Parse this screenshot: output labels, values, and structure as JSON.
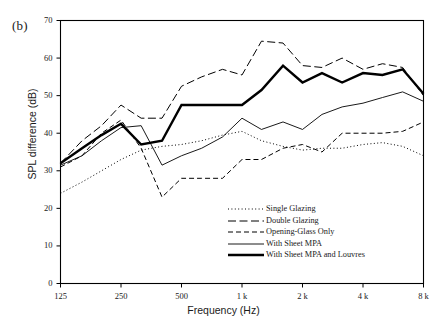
{
  "figure": {
    "panel_label": "(b)",
    "xlabel": "Frequency (Hz)",
    "ylabel": "SPL difference (dB)"
  },
  "axes": {
    "y_ticks": [
      "0",
      "10",
      "20",
      "30",
      "40",
      "50",
      "60",
      "70"
    ],
    "x_ticks": [
      "125",
      "250",
      "500",
      "1 k",
      "2 k",
      "4 k",
      "8 k"
    ]
  },
  "legend": {
    "items": [
      {
        "label": "Single Glazing",
        "style": "dotted"
      },
      {
        "label": "Double Glazing",
        "style": "long-dash"
      },
      {
        "label": "Opening-Glass Only",
        "style": "dash"
      },
      {
        "label": "With Sheet MPA",
        "style": "thin-solid"
      },
      {
        "label": "With Sheet MPA and Louvres",
        "style": "thick-solid"
      }
    ]
  },
  "colors": {
    "line": "#000000",
    "axis": "#000000",
    "background": "#ffffff"
  },
  "chart_data": {
    "type": "line",
    "title": "",
    "subtitle": "",
    "xlabel": "Frequency (Hz)",
    "ylabel": "SPL difference (dB)",
    "xscale": "log",
    "xlim": [
      125,
      8000
    ],
    "ylim": [
      0,
      70
    ],
    "ytick_interval": 10,
    "grid": false,
    "legend_position": "inside lower-right",
    "x": [
      125,
      160,
      200,
      250,
      315,
      400,
      500,
      630,
      800,
      1000,
      1250,
      1600,
      2000,
      2500,
      3150,
      4000,
      5000,
      6300,
      8000
    ],
    "x_tick_labels": [
      "125",
      "250",
      "500",
      "1 k",
      "2 k",
      "4 k",
      "8 k"
    ],
    "x_tick_values": [
      125,
      250,
      500,
      1000,
      2000,
      4000,
      8000
    ],
    "series": [
      {
        "name": "Single Glazing",
        "style": "dotted",
        "values": [
          24,
          27,
          30,
          33,
          35.5,
          36.5,
          37,
          38,
          39.5,
          40.5,
          38,
          36.5,
          35.5,
          36,
          36,
          37,
          37.5,
          36.5,
          34
        ]
      },
      {
        "name": "Double Glazing",
        "style": "long-dash",
        "values": [
          32,
          38,
          42,
          47.5,
          44,
          44,
          52.5,
          55,
          57,
          55.5,
          64.5,
          64,
          58,
          57.5,
          60,
          57,
          58.5,
          57.5,
          50
        ]
      },
      {
        "name": "Opening-Glass Only",
        "style": "dash",
        "values": [
          31,
          34,
          40,
          43.5,
          36,
          23,
          28,
          28,
          28,
          33,
          33,
          36,
          37,
          35,
          40,
          40,
          40,
          40.5,
          43
        ]
      },
      {
        "name": "With Sheet MPA",
        "style": "thin-solid",
        "values": [
          31.5,
          34,
          38,
          41.5,
          42,
          31.5,
          34,
          36,
          39,
          44,
          41,
          43,
          41,
          45,
          47,
          48,
          49.5,
          51,
          48.5
        ]
      },
      {
        "name": "With Sheet MPA and Louvres",
        "style": "thick-solid",
        "values": [
          32,
          36,
          39.5,
          42.5,
          37,
          38,
          47.5,
          47.5,
          47.5,
          47.5,
          51.5,
          58,
          53.5,
          56,
          53.5,
          56,
          55.5,
          57,
          50.5
        ]
      }
    ]
  }
}
